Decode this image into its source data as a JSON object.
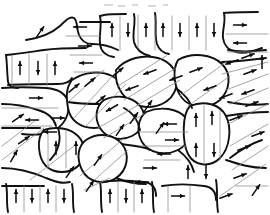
{
  "figure": {
    "caption": "",
    "width": 270,
    "height": 215,
    "background_color": "#ffffff",
    "grain_boundary_color": "#111111",
    "domain_wall_color": "#8d8d8d",
    "arrow_color": "#0d0d0d",
    "grain_count": 24,
    "arrow_count": 74,
    "legend_entries": [],
    "annotations": [],
    "axis_labels": [],
    "tick_labels": []
  },
  "chart_data": {
    "type": "diagram",
    "xlabel": "",
    "ylabel": "",
    "grid": false,
    "legend_position": "none",
    "xlim": [
      0,
      270
    ],
    "ylim": [
      0,
      215
    ],
    "grains": [
      {
        "id": "g1",
        "label": "grain-upper-left",
        "domain_wall_orientation": "horizontal"
      },
      {
        "id": "g2",
        "label": "grain-top-center-left",
        "domain_wall_orientation": "vertical"
      },
      {
        "id": "g3",
        "label": "grain-top-center",
        "domain_wall_orientation": "vertical"
      },
      {
        "id": "g4",
        "label": "grain-top-right",
        "domain_wall_orientation": "horizontal"
      },
      {
        "id": "g5",
        "label": "grain-left-upper",
        "domain_wall_orientation": "vertical"
      },
      {
        "id": "g6",
        "label": "grain-left-mid",
        "domain_wall_orientation": "horizontal"
      },
      {
        "id": "g7",
        "label": "grain-center-oval",
        "domain_wall_orientation": "diagonal"
      },
      {
        "id": "g8",
        "label": "grain-right-upper",
        "domain_wall_orientation": "diagonal"
      },
      {
        "id": "g9",
        "label": "grain-right-edge",
        "domain_wall_orientation": "diagonal"
      },
      {
        "id": "g10",
        "label": "grain-center-mid",
        "domain_wall_orientation": "diagonal"
      },
      {
        "id": "g11",
        "label": "grain-center-small",
        "domain_wall_orientation": "diagonal"
      },
      {
        "id": "g12",
        "label": "grain-left-lower",
        "domain_wall_orientation": "horizontal"
      },
      {
        "id": "g13",
        "label": "grain-lower-left-cell",
        "domain_wall_orientation": "vertical"
      },
      {
        "id": "g14",
        "label": "grain-lower-center",
        "domain_wall_orientation": "diagonal"
      },
      {
        "id": "g15",
        "label": "grain-mid-right-block",
        "domain_wall_orientation": "horizontal"
      },
      {
        "id": "g16",
        "label": "grain-right-column",
        "domain_wall_orientation": "vertical"
      },
      {
        "id": "g17",
        "label": "grain-right-lower",
        "domain_wall_orientation": "diagonal"
      },
      {
        "id": "g18",
        "label": "grain-bottom-left",
        "domain_wall_orientation": "diagonal"
      },
      {
        "id": "g19",
        "label": "grain-bottom-center",
        "domain_wall_orientation": "vertical"
      },
      {
        "id": "g20",
        "label": "grain-bottom-right",
        "domain_wall_orientation": "vertical"
      },
      {
        "id": "g21",
        "label": "grain-bottom-edge",
        "domain_wall_orientation": "diagonal"
      },
      {
        "id": "g22",
        "label": "grain-mid-lower-left",
        "domain_wall_orientation": "vertical"
      },
      {
        "id": "g23",
        "label": "grain-upper-mid-left",
        "domain_wall_orientation": "horizontal"
      },
      {
        "id": "g24",
        "label": "grain-far-right",
        "domain_wall_orientation": "diagonal"
      }
    ],
    "magnetization_arrows": [
      {
        "x": 40,
        "y": 32,
        "angle": -55
      },
      {
        "x": 80,
        "y": 27,
        "angle": 180
      },
      {
        "x": 85,
        "y": 46,
        "angle": 0
      },
      {
        "x": 86,
        "y": 63,
        "angle": 180
      },
      {
        "x": 112,
        "y": 30,
        "angle": -90
      },
      {
        "x": 128,
        "y": 30,
        "angle": 90
      },
      {
        "x": 146,
        "y": 30,
        "angle": -90
      },
      {
        "x": 163,
        "y": 30,
        "angle": -90
      },
      {
        "x": 180,
        "y": 30,
        "angle": 90
      },
      {
        "x": 197,
        "y": 30,
        "angle": -90
      },
      {
        "x": 214,
        "y": 30,
        "angle": 90
      },
      {
        "x": 240,
        "y": 25,
        "angle": 0
      },
      {
        "x": 240,
        "y": 43,
        "angle": 180
      },
      {
        "x": 20,
        "y": 68,
        "angle": -90
      },
      {
        "x": 38,
        "y": 68,
        "angle": 90
      },
      {
        "x": 55,
        "y": 68,
        "angle": -90
      },
      {
        "x": 36,
        "y": 98,
        "angle": 0
      },
      {
        "x": 32,
        "y": 120,
        "angle": 180
      },
      {
        "x": 74,
        "y": 88,
        "angle": -40
      },
      {
        "x": 90,
        "y": 82,
        "angle": -40
      },
      {
        "x": 100,
        "y": 100,
        "angle": -40
      },
      {
        "x": 118,
        "y": 72,
        "angle": -40
      },
      {
        "x": 132,
        "y": 88,
        "angle": 160
      },
      {
        "x": 150,
        "y": 72,
        "angle": 160
      },
      {
        "x": 176,
        "y": 78,
        "angle": 160
      },
      {
        "x": 196,
        "y": 70,
        "angle": -20
      },
      {
        "x": 210,
        "y": 88,
        "angle": 160
      },
      {
        "x": 232,
        "y": 62,
        "angle": 160
      },
      {
        "x": 250,
        "y": 72,
        "angle": -20
      },
      {
        "x": 248,
        "y": 56,
        "angle": -20
      },
      {
        "x": 226,
        "y": 96,
        "angle": 160
      },
      {
        "x": 248,
        "y": 92,
        "angle": 160
      },
      {
        "x": 24,
        "y": 140,
        "angle": -35
      },
      {
        "x": 18,
        "y": 118,
        "angle": -35
      },
      {
        "x": 14,
        "y": 156,
        "angle": -60
      },
      {
        "x": 58,
        "y": 118,
        "angle": 0
      },
      {
        "x": 50,
        "y": 132,
        "angle": 180
      },
      {
        "x": 56,
        "y": 148,
        "angle": -90
      },
      {
        "x": 76,
        "y": 148,
        "angle": -90
      },
      {
        "x": 70,
        "y": 172,
        "angle": -55
      },
      {
        "x": 98,
        "y": 160,
        "angle": -55
      },
      {
        "x": 120,
        "y": 130,
        "angle": -55
      },
      {
        "x": 112,
        "y": 108,
        "angle": 150
      },
      {
        "x": 134,
        "y": 118,
        "angle": -55
      },
      {
        "x": 148,
        "y": 106,
        "angle": -55
      },
      {
        "x": 160,
        "y": 128,
        "angle": -55
      },
      {
        "x": 170,
        "y": 124,
        "angle": 180
      },
      {
        "x": 172,
        "y": 140,
        "angle": 0
      },
      {
        "x": 164,
        "y": 154,
        "angle": 180
      },
      {
        "x": 150,
        "y": 168,
        "angle": 0
      },
      {
        "x": 142,
        "y": 182,
        "angle": 180
      },
      {
        "x": 196,
        "y": 120,
        "angle": -90
      },
      {
        "x": 212,
        "y": 118,
        "angle": -90
      },
      {
        "x": 196,
        "y": 150,
        "angle": -90
      },
      {
        "x": 214,
        "y": 150,
        "angle": 90
      },
      {
        "x": 188,
        "y": 172,
        "angle": -90
      },
      {
        "x": 206,
        "y": 172,
        "angle": 90
      },
      {
        "x": 236,
        "y": 118,
        "angle": -20
      },
      {
        "x": 252,
        "y": 104,
        "angle": -20
      },
      {
        "x": 244,
        "y": 148,
        "angle": -20
      },
      {
        "x": 258,
        "y": 134,
        "angle": -20
      },
      {
        "x": 240,
        "y": 176,
        "angle": -20
      },
      {
        "x": 226,
        "y": 196,
        "angle": -20
      },
      {
        "x": 178,
        "y": 196,
        "angle": 0
      },
      {
        "x": 110,
        "y": 196,
        "angle": -90
      },
      {
        "x": 126,
        "y": 196,
        "angle": 90
      },
      {
        "x": 142,
        "y": 196,
        "angle": -90
      },
      {
        "x": 16,
        "y": 196,
        "angle": -90
      },
      {
        "x": 32,
        "y": 196,
        "angle": 90
      },
      {
        "x": 48,
        "y": 196,
        "angle": -90
      },
      {
        "x": 64,
        "y": 196,
        "angle": 90
      },
      {
        "x": 90,
        "y": 186,
        "angle": -55
      },
      {
        "x": 256,
        "y": 190,
        "angle": -55
      },
      {
        "x": 262,
        "y": 62,
        "angle": -90
      }
    ]
  }
}
